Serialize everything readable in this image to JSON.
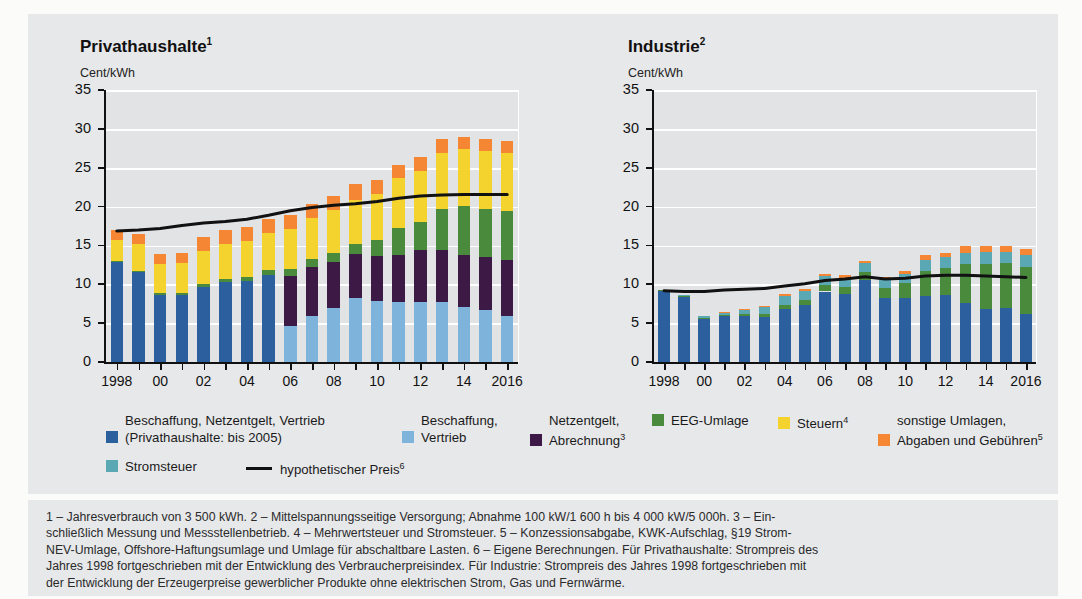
{
  "panel": {
    "ghost_top_text": ""
  },
  "charts": [
    {
      "id": "privathaushalte",
      "title": "Privathaushalte",
      "title_sup": "1",
      "unit": "Cent/kWh"
    },
    {
      "id": "industrie",
      "title": "Industrie",
      "title_sup": "2",
      "unit": "Cent/kWh"
    }
  ],
  "legend": {
    "items": [
      {
        "name": "beschaffung-netzentgelt-vertrieb",
        "color": "#2b5f9e",
        "label": "Beschaffung, Netzentgelt, Vertrieb",
        "sub": "(Privathaushalte: bis 2005)",
        "sup": ""
      },
      {
        "name": "beschaffung-vertrieb",
        "color": "#7eb3dc",
        "label": "Beschaffung,",
        "sub": "Vertrieb",
        "sup": ""
      },
      {
        "name": "netzentgelt-abrechnung",
        "color": "#3d1a45",
        "label": "Netzentgelt,",
        "sub": "Abrechnung",
        "sup": "3"
      },
      {
        "name": "eeg-umlage",
        "color": "#4a8a3c",
        "label": "EEG-Umlage",
        "sub": "",
        "sup": ""
      },
      {
        "name": "steuern",
        "color": "#f5d32e",
        "label": "Steuern",
        "sub": "",
        "sup": "4"
      },
      {
        "name": "sonstige-umlagen",
        "color": "#f58634",
        "label": "sonstige Umlagen,",
        "sub": "Abgaben und Gebühren",
        "sup": "5"
      },
      {
        "name": "stromsteuer",
        "color": "#5ba8b5",
        "label": "Stromsteuer",
        "sub": "",
        "sup": ""
      }
    ],
    "line_item": {
      "name": "hypothetischer-preis",
      "label": "hypothetischer Preis",
      "sup": "6"
    }
  },
  "footnotes": {
    "lines": [
      "1 – Jahresverbrauch von 3 500 kWh.  2 – Mittelspannungsseitige Versorgung; Abnahme 100 kW/1 600 h bis 4 000 kW/5 000h.  3 – Ein-",
      "schließlich Messung und Messstellenbetrieb.  4 – Mehrwertsteuer und Stromsteuer.  5 – Konzessionsabgabe, KWK-Aufschlag, §19 Strom-",
      "NEV-Umlage, Offshore-Haftungsumlage und Umlage für abschaltbare Lasten.  6 – Eigene Berechnungen. Für Privathaushalte: Strompreis des",
      "Jahres 1998 fortgeschrieben mit der Entwicklung des Verbraucherpreisindex. Für Industrie: Strompreis des Jahres 1998 fortgeschrieben mit",
      "der Entwicklung der Erzeugerpreise gewerblicher Produkte ohne elektrischen Strom, Gas und Fernwärme."
    ]
  },
  "chart_data": [
    {
      "type": "bar",
      "id": "privathaushalte",
      "title": "Privathaushalte",
      "subtitle": "Jahresverbrauch von 3 500 kWh",
      "ylabel": "Cent/kWh",
      "xlabel": "",
      "ylim": [
        0,
        35
      ],
      "yticks": [
        0,
        5,
        10,
        15,
        20,
        25,
        30,
        35
      ],
      "ytick_labels": [
        "0",
        "5",
        "10",
        "15",
        "20",
        "25",
        "30",
        "35"
      ],
      "grid": true,
      "legend_position": "below",
      "stacked": true,
      "categories": [
        1998,
        1999,
        2000,
        2001,
        2002,
        2003,
        2004,
        2005,
        2006,
        2007,
        2008,
        2009,
        2010,
        2011,
        2012,
        2013,
        2014,
        2015,
        2016
      ],
      "xtick_labels": [
        "1998",
        "",
        "00",
        "",
        "02",
        "",
        "04",
        "",
        "06",
        "",
        "08",
        "",
        "10",
        "",
        "12",
        "",
        "14",
        "",
        "2016"
      ],
      "series": [
        {
          "name": "Beschaffung, Netzentgelt, Vertrieb (bis 2005)",
          "color": "#2b5f9e",
          "values": [
            13.1,
            11.8,
            8.8,
            8.8,
            9.8,
            10.4,
            10.6,
            11.3,
            0,
            0,
            0,
            0,
            0,
            0,
            0,
            0,
            0,
            0,
            0
          ]
        },
        {
          "name": "Beschaffung, Vertrieb",
          "color": "#7eb3dc",
          "values": [
            0,
            0,
            0,
            0,
            0,
            0,
            0,
            0,
            4.8,
            6.0,
            7.1,
            8.4,
            8.0,
            7.9,
            7.9,
            7.8,
            7.2,
            6.8,
            6.1
          ]
        },
        {
          "name": "Netzentgelt, Abrechnung",
          "color": "#3d1a45",
          "values": [
            0,
            0,
            0,
            0,
            0,
            0,
            0,
            0,
            6.4,
            6.3,
            5.9,
            5.6,
            5.8,
            6.0,
            6.6,
            6.8,
            6.7,
            6.9,
            7.1
          ]
        },
        {
          "name": "EEG-Umlage",
          "color": "#4a8a3c",
          "values": [
            0.08,
            0.1,
            0.2,
            0.23,
            0.35,
            0.41,
            0.51,
            0.69,
            0.88,
            1.02,
            1.16,
            1.31,
            2.05,
            3.53,
            3.59,
            5.28,
            6.24,
            6.17,
            6.35
          ]
        },
        {
          "name": "Steuern",
          "color": "#f5d32e",
          "values": [
            2.6,
            3.4,
            3.7,
            3.8,
            4.2,
            4.5,
            4.6,
            4.8,
            5.1,
            5.4,
            5.5,
            5.6,
            5.9,
            6.4,
            6.6,
            7.2,
            7.4,
            7.4,
            7.5
          ]
        },
        {
          "name": "sonstige Umlagen, Abgaben und Gebühren",
          "color": "#f58634",
          "values": [
            1.3,
            1.3,
            1.3,
            1.3,
            1.8,
            1.8,
            1.8,
            1.8,
            1.8,
            1.8,
            1.8,
            2.1,
            1.8,
            1.7,
            1.8,
            1.8,
            1.6,
            1.5,
            1.5
          ]
        }
      ],
      "line": {
        "name": "hypothetischer Preis",
        "color": "#111111",
        "values": [
          17.0,
          17.1,
          17.3,
          17.7,
          18.0,
          18.2,
          18.5,
          19.0,
          19.6,
          20.0,
          20.3,
          20.5,
          20.8,
          21.2,
          21.5,
          21.6,
          21.7,
          21.7,
          21.7
        ]
      },
      "totals": [
        17.1,
        16.6,
        14.0,
        14.4,
        16.2,
        17.2,
        17.5,
        18.6,
        19.0,
        20.5,
        21.5,
        23.0,
        23.6,
        25.0,
        26.5,
        28.9,
        29.1,
        28.7,
        28.7
      ]
    },
    {
      "type": "bar",
      "id": "industrie",
      "title": "Industrie",
      "subtitle": "Mittelspannungsseitige Versorgung",
      "ylabel": "Cent/kWh",
      "xlabel": "",
      "ylim": [
        0,
        35
      ],
      "yticks": [
        0,
        5,
        10,
        15,
        20,
        25,
        30,
        35
      ],
      "ytick_labels": [
        "0",
        "5",
        "10",
        "15",
        "20",
        "25",
        "30",
        "35"
      ],
      "grid": true,
      "legend_position": "below",
      "stacked": true,
      "categories": [
        1998,
        1999,
        2000,
        2001,
        2002,
        2003,
        2004,
        2005,
        2006,
        2007,
        2008,
        2009,
        2010,
        2011,
        2012,
        2013,
        2014,
        2015,
        2016
      ],
      "xtick_labels": [
        "1998",
        "",
        "00",
        "",
        "02",
        "",
        "04",
        "",
        "06",
        "",
        "08",
        "",
        "10",
        "",
        "12",
        "",
        "14",
        "",
        "2016"
      ],
      "series": [
        {
          "name": "Beschaffung, Netzentgelt, Vertrieb",
          "color": "#2b5f9e",
          "values": [
            9.3,
            8.6,
            5.7,
            6.0,
            6.0,
            5.9,
            7.0,
            7.5,
            9.2,
            8.9,
            10.7,
            8.4,
            8.4,
            8.6,
            8.8,
            7.7,
            6.9,
            7.1,
            6.3
          ]
        },
        {
          "name": "EEG-Umlage",
          "color": "#4a8a3c",
          "values": [
            0.05,
            0.08,
            0.15,
            0.2,
            0.3,
            0.35,
            0.45,
            0.6,
            0.8,
            0.9,
            1.0,
            1.2,
            1.9,
            3.2,
            3.4,
            5.0,
            5.9,
            5.8,
            6.1
          ]
        },
        {
          "name": "Stromsteuer",
          "color": "#5ba8b5",
          "values": [
            0,
            0.1,
            0.2,
            0.3,
            0.6,
            0.9,
            1.2,
            1.2,
            1.2,
            1.2,
            1.2,
            1.2,
            1.2,
            1.5,
            1.4,
            1.5,
            1.5,
            1.4,
            1.5
          ]
        },
        {
          "name": "sonstige Umlagen, Abgaben und Gebühren",
          "color": "#f58634",
          "values": [
            0,
            0,
            0,
            0.05,
            0.1,
            0.15,
            0.2,
            0.2,
            0.2,
            0.3,
            0.2,
            0.3,
            0.4,
            0.6,
            0.5,
            0.8,
            0.7,
            0.7,
            0.8
          ]
        }
      ],
      "line": {
        "name": "hypothetischer Preis",
        "color": "#111111",
        "values": [
          9.3,
          9.2,
          9.2,
          9.4,
          9.5,
          9.6,
          9.9,
          10.2,
          10.6,
          10.8,
          11.1,
          10.8,
          10.9,
          11.2,
          11.3,
          11.3,
          11.2,
          11.1,
          11.0
        ]
      },
      "totals": [
        9.4,
        8.8,
        6.1,
        6.5,
        7.0,
        7.9,
        8.8,
        9.5,
        11.4,
        11.3,
        13.1,
        11.1,
        11.9,
        13.9,
        14.1,
        15.0,
        15.0,
        15.0,
        14.7
      ]
    }
  ]
}
